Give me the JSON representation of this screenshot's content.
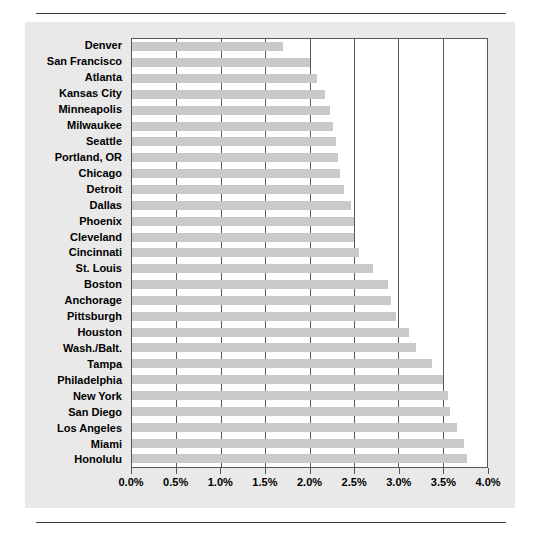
{
  "figure": {
    "panel_background": "#e9e9e9",
    "bar_color": "#c9c9c9",
    "axis_color": "#585858"
  },
  "chart_data": {
    "type": "bar",
    "orientation": "horizontal",
    "title": "",
    "xlabel": "",
    "ylabel": "",
    "xlim": [
      0.0,
      4.0
    ],
    "grid": true,
    "legend": false,
    "xtick_labels": [
      "0.0%",
      "0.5%",
      "1.0%",
      "1.5%",
      "2.0%",
      "2.5%",
      "3.0%",
      "3.5%",
      "4.0%"
    ],
    "xtick_values": [
      0.0,
      0.5,
      1.0,
      1.5,
      2.0,
      2.5,
      3.0,
      3.5,
      4.0
    ],
    "categories": [
      "Denver",
      "San Francisco",
      "Atlanta",
      "Kansas City",
      "Minneapolis",
      "Milwaukee",
      "Seattle",
      "Portland, OR",
      "Chicago",
      "Detroit",
      "Dallas",
      "Phoenix",
      "Cleveland",
      "Cincinnati",
      "St. Louis",
      "Boston",
      "Anchorage",
      "Pittsburgh",
      "Houston",
      "Wash./Balt.",
      "Tampa",
      "Philadelphia",
      "New York",
      "San Diego",
      "Los Angeles",
      "Miami",
      "Honolulu"
    ],
    "values": [
      1.7,
      2.0,
      2.08,
      2.18,
      2.23,
      2.26,
      2.3,
      2.32,
      2.34,
      2.39,
      2.47,
      2.5,
      2.5,
      2.56,
      2.72,
      2.88,
      2.92,
      2.98,
      3.12,
      3.2,
      3.38,
      3.5,
      3.56,
      3.58,
      3.66,
      3.74,
      3.77
    ]
  }
}
